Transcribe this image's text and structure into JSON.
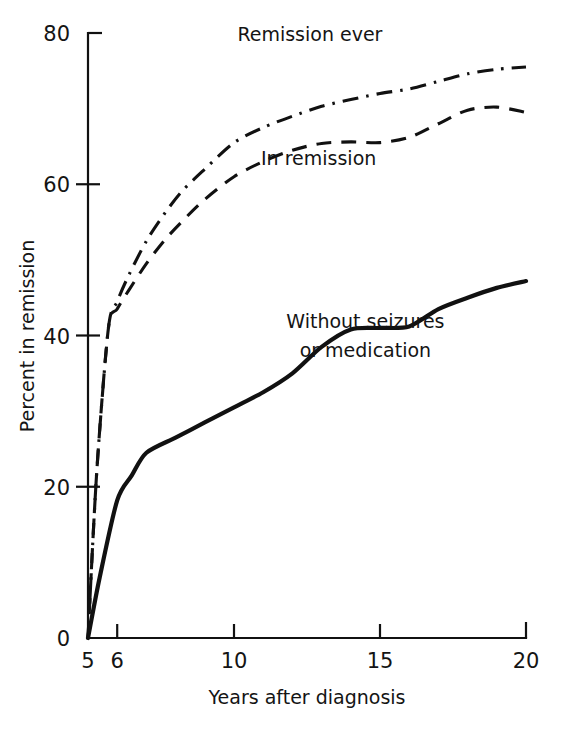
{
  "chart_data": {
    "type": "line",
    "title": "",
    "xlabel": "Years after diagnosis",
    "ylabel": "Percent in remission",
    "xlim": [
      5,
      20
    ],
    "ylim": [
      0,
      80
    ],
    "xticks": [
      5,
      6,
      10,
      15,
      20
    ],
    "xtick_labels": [
      "5",
      "6",
      "10",
      "15",
      "20"
    ],
    "yticks": [
      0,
      20,
      40,
      60,
      80
    ],
    "ytick_labels": [
      "0",
      "20",
      "40",
      "60",
      "80"
    ],
    "grid": false,
    "legend_position": "inline-annotations",
    "series": [
      {
        "name": "Remission ever",
        "style": "dash-dot",
        "label_text": "Remission ever",
        "x": [
          5,
          5.3,
          5.7,
          6.0,
          6.4,
          7.0,
          7.6,
          8.2,
          9.0,
          10.0,
          11.0,
          12.0,
          13.0,
          14.0,
          15.0,
          16.0,
          17.0,
          18.0,
          19.0,
          20.0
        ],
        "y": [
          0,
          22,
          41,
          44.5,
          48,
          52.5,
          56,
          59,
          62,
          65.5,
          67.5,
          69,
          70.3,
          71.2,
          72,
          72.6,
          73.6,
          74.6,
          75.2,
          75.5
        ]
      },
      {
        "name": "In remission",
        "style": "dashed",
        "label_text": "In remission",
        "x": [
          5,
          5.3,
          5.7,
          6.0,
          6.4,
          7.0,
          7.6,
          8.2,
          9.0,
          10.0,
          11.0,
          12.0,
          13.0,
          14.0,
          15.0,
          16.0,
          17.0,
          18.0,
          19.0,
          20.0
        ],
        "y": [
          0,
          22,
          41,
          43.5,
          46,
          49.5,
          52.5,
          55,
          58,
          61,
          63,
          64.5,
          65.4,
          65.6,
          65.5,
          66.2,
          68,
          69.8,
          70.2,
          69.5
        ]
      },
      {
        "name": "Without seizures or medication",
        "style": "solid",
        "label_text": "Without seizures\nor medication",
        "label_line_1": "Without seizures",
        "label_line_2": "or medication",
        "x": [
          5,
          5.4,
          6.0,
          6.5,
          7.0,
          8.0,
          9.0,
          10.0,
          11.0,
          12.0,
          13.0,
          14.0,
          15.0,
          16.0,
          17.0,
          18.0,
          19.0,
          20.0
        ],
        "y": [
          0,
          8,
          18.2,
          21.5,
          24.5,
          26.5,
          28.5,
          30.5,
          32.5,
          35,
          38.5,
          40.8,
          41,
          41.2,
          43.5,
          45,
          46.3,
          47.2
        ]
      }
    ],
    "annotations": [
      {
        "text": "Remission ever",
        "x": 12.6,
        "y": 79.0
      },
      {
        "text": "In remission",
        "x": 12.9,
        "y": 62.5
      },
      {
        "text": "Without seizures",
        "x": 14.5,
        "y": 41.0
      },
      {
        "text": "or medication",
        "x": 14.5,
        "y": 37.2
      }
    ]
  },
  "colors": {
    "ink": "#111111",
    "background": "#ffffff"
  }
}
